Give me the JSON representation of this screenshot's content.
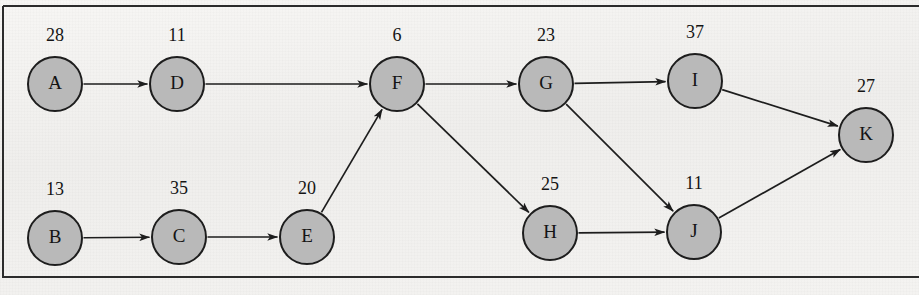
{
  "figure": {
    "type": "directed-acyclic-graph",
    "title": "",
    "background_color": "#f3f3f1",
    "node_fill_color": "#b9b9b9",
    "node_stroke_color": "#1d1d1d",
    "edge_color": "#1d1d1d",
    "frame_color": "#2b2b2b",
    "node_radius": 27
  },
  "graph_data": {
    "nodes": [
      {
        "id": "A",
        "label": "A",
        "weight": "28",
        "cx": 55,
        "cy": 84,
        "weight_x": 55,
        "weight_y": 41
      },
      {
        "id": "D",
        "label": "D",
        "weight": "11",
        "cx": 177,
        "cy": 84,
        "weight_x": 177,
        "weight_y": 41
      },
      {
        "id": "F",
        "label": "F",
        "weight": "6",
        "cx": 397,
        "cy": 84,
        "weight_x": 397,
        "weight_y": 41
      },
      {
        "id": "G",
        "label": "G",
        "weight": "23",
        "cx": 546,
        "cy": 84,
        "weight_x": 546,
        "weight_y": 41
      },
      {
        "id": "I",
        "label": "I",
        "weight": "37",
        "cx": 695,
        "cy": 81,
        "weight_x": 695,
        "weight_y": 38
      },
      {
        "id": "K",
        "label": "K",
        "weight": "27",
        "cx": 866,
        "cy": 135,
        "weight_x": 866,
        "weight_y": 92
      },
      {
        "id": "B",
        "label": "B",
        "weight": "13",
        "cx": 55,
        "cy": 238,
        "weight_x": 55,
        "weight_y": 195
      },
      {
        "id": "C",
        "label": "C",
        "weight": "35",
        "cx": 179,
        "cy": 237,
        "weight_x": 179,
        "weight_y": 194
      },
      {
        "id": "E",
        "label": "E",
        "weight": "20",
        "cx": 307,
        "cy": 237,
        "weight_x": 307,
        "weight_y": 194
      },
      {
        "id": "H",
        "label": "H",
        "weight": "25",
        "cx": 550,
        "cy": 233,
        "weight_x": 550,
        "weight_y": 190
      },
      {
        "id": "J",
        "label": "J",
        "weight": "11",
        "cx": 694,
        "cy": 232,
        "weight_x": 694,
        "weight_y": 189
      }
    ],
    "edges": [
      {
        "from": "A",
        "to": "D"
      },
      {
        "from": "D",
        "to": "F"
      },
      {
        "from": "F",
        "to": "G"
      },
      {
        "from": "G",
        "to": "I"
      },
      {
        "from": "I",
        "to": "K"
      },
      {
        "from": "B",
        "to": "C"
      },
      {
        "from": "C",
        "to": "E"
      },
      {
        "from": "E",
        "to": "F"
      },
      {
        "from": "F",
        "to": "H"
      },
      {
        "from": "G",
        "to": "J"
      },
      {
        "from": "H",
        "to": "J"
      },
      {
        "from": "J",
        "to": "K"
      }
    ],
    "node_weights": {
      "A": 28,
      "B": 13,
      "C": 35,
      "D": 11,
      "E": 20,
      "F": 6,
      "G": 23,
      "H": 25,
      "I": 37,
      "J": 11,
      "K": 27
    },
    "frame": {
      "x": 3,
      "y": 6,
      "width": 916,
      "height": 271
    }
  }
}
